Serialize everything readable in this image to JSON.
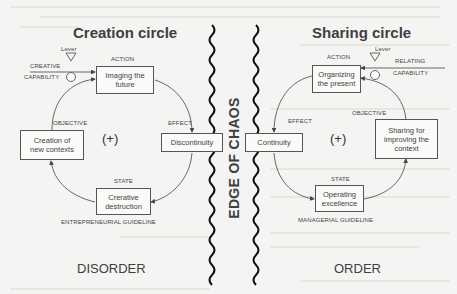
{
  "left": {
    "title": "Creation circle",
    "lever": "Lever",
    "capability": [
      "CREATIVE",
      "CAPABILITY"
    ],
    "action_label": "ACTION",
    "action_box": [
      "Imaging the",
      "future"
    ],
    "objective_label": "OBJECTIVE",
    "objective_box": [
      "Creation of",
      "new contexts"
    ],
    "loop_sign": "(+)",
    "effect_label": "EFFECT",
    "effect_box": "Discontinuity",
    "state_label": "STATE",
    "state_box": [
      "Crerative",
      "destruction"
    ],
    "guideline": "ENTREPRENEURIAL GUIDELINE",
    "zone": "DISORDER"
  },
  "center": {
    "label": "EDGE OF CHAOS"
  },
  "right": {
    "title": "Sharing circle",
    "lever": "Lever",
    "capability": [
      "RELATING",
      "CAPABILITY"
    ],
    "action_label": "ACTION",
    "action_box": [
      "Organizing",
      "the present"
    ],
    "objective_label": "OBJECTIVE",
    "objective_box": [
      "Sharing for",
      "improving the",
      "context"
    ],
    "loop_sign": "(+)",
    "effect_label": "EFFECT",
    "effect_box": "Continuity",
    "state_label": "STATE",
    "state_box": [
      "Operating",
      "excellence"
    ],
    "guideline": "MANAGERIAL GUIDELINE",
    "zone": "ORDER"
  }
}
